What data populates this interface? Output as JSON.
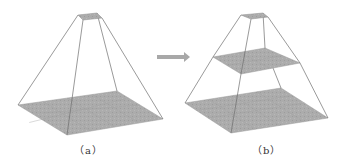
{
  "figure": {
    "panels": [
      {
        "label": "（a）",
        "description": "single pyramid",
        "top": [
          [
            78,
            15
          ],
          [
            97,
            13
          ],
          [
            102,
            18
          ],
          [
            83,
            20
          ]
        ],
        "base": [
          [
            18,
            105
          ],
          [
            117,
            91
          ],
          [
            163,
            119
          ],
          [
            67,
            135
          ]
        ]
      },
      {
        "label": "（b）",
        "description": "two-level pyramid",
        "top": [
          [
            241,
            15
          ],
          [
            263,
            13
          ],
          [
            268,
            17
          ],
          [
            251,
            19
          ]
        ],
        "middle": [
          [
            213,
            57
          ],
          [
            265,
            48
          ],
          [
            300,
            63
          ],
          [
            241,
            74
          ]
        ],
        "base": [
          [
            185,
            103
          ],
          [
            281,
            88
          ],
          [
            328,
            118
          ],
          [
            231,
            133
          ]
        ]
      }
    ],
    "arrow": {
      "from": [
        157,
        57
      ],
      "to": [
        190,
        57
      ],
      "color": "#a8a8a8"
    },
    "colors": {
      "plane_fill": "#a9a9a9",
      "edge": "#6e6e6e",
      "grid": "#9a9a9a"
    }
  }
}
